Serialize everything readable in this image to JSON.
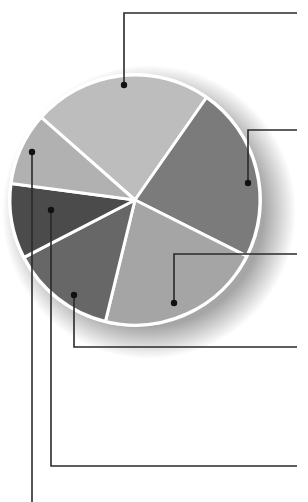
{
  "chart_data": {
    "type": "pie",
    "title": "",
    "legend": "none",
    "labels_visible": false,
    "start_angle_deg_clockwise_from_top": 311.4,
    "categories": [
      "Slice 1",
      "Slice 2",
      "Slice 3",
      "Slice 4",
      "Slice 5",
      "Slice 6"
    ],
    "values": [
      23.2,
      22.7,
      21.4,
      13.6,
      9.7,
      9.4
    ],
    "colors": [
      "#bdbdbd",
      "#7b7b7b",
      "#a5a5a5",
      "#676767",
      "#4b4b4b",
      "#b1b1b1"
    ],
    "separator_color": "#ffffff",
    "center": [
      135,
      200
    ],
    "radius": 125,
    "leaders": [
      {
        "slice": 0,
        "dot": [
          124,
          85
        ],
        "path": [
          [
            124,
            85
          ],
          [
            124,
            13
          ],
          [
            297,
            13
          ]
        ]
      },
      {
        "slice": 1,
        "dot": [
          248,
          183
        ],
        "path": [
          [
            248,
            183
          ],
          [
            248,
            130
          ],
          [
            297,
            130
          ]
        ]
      },
      {
        "slice": 2,
        "dot": [
          174,
          303
        ],
        "path": [
          [
            174,
            303
          ],
          [
            174,
            254
          ],
          [
            297,
            254
          ]
        ]
      },
      {
        "slice": 3,
        "dot": [
          74,
          295
        ],
        "path": [
          [
            74,
            295
          ],
          [
            74,
            347
          ],
          [
            297,
            347
          ]
        ]
      },
      {
        "slice": 4,
        "dot": [
          51,
          210
        ],
        "path": [
          [
            51,
            210
          ],
          [
            51,
            466
          ],
          [
            297,
            466
          ]
        ]
      },
      {
        "slice": 5,
        "dot": [
          32,
          152
        ],
        "path": [
          [
            32,
            152
          ],
          [
            32,
            502
          ]
        ]
      }
    ]
  }
}
